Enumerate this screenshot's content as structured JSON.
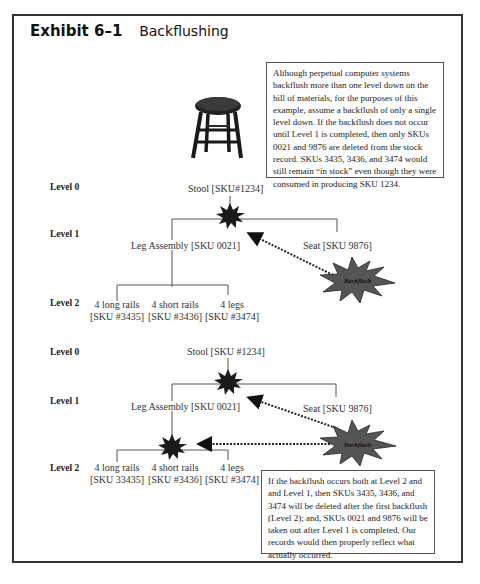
{
  "exhibit": {
    "number": "Exhibit 6–1",
    "title": "Backflushing"
  },
  "notes": {
    "top": "Although perpetual computer systems backflush more than one level down on the bill of materials, for the purposes of this example, assume a backflush of only a single level down. If the backflush does not occur until Level 1 is completed, then only SKUs 0021 and 9876 are deleted from the stock record. SKUs 3435, 3436, and 3474 would still remain “in stock” even though they were consumed in producing SKU 1234.",
    "bottom": "If the backflush occurs both at Level 2 and and Level 1, then SKUs 3435, 3436, and 3474 will be deleted after the first backflush (Level 2); and, SKUs 0021 and 9876 will be taken out after Level 1 is completed. Our records would then properly reflect what actually occurred."
  },
  "diagram_top": {
    "levels": [
      "Level 0",
      "Level 1",
      "Level 2"
    ],
    "level0": "Stool [SKU#1234]",
    "level1": [
      "Leg Assembly [SKU 0021]",
      "Seat [SKU 9876]"
    ],
    "level2": [
      {
        "name": "4 long rails",
        "sku": "[SKU #3435]"
      },
      {
        "name": "4 short rails",
        "sku": "[SKU #3436]"
      },
      {
        "name": "4 legs",
        "sku": "[SKU #3474]"
      }
    ],
    "backflush_label": "Backflush"
  },
  "diagram_bottom": {
    "levels": [
      "Level 0",
      "Level 1",
      "Level 2"
    ],
    "level0": "Stool [SKU #1234]",
    "level1": [
      "Leg Assembly [SKU 0021]",
      "Seat [SKU 9876]"
    ],
    "level2": [
      {
        "name": "4 long rails",
        "sku": "[SKU 33435]"
      },
      {
        "name": "4 short rails",
        "sku": "[SKU #3436]"
      },
      {
        "name": "4 legs",
        "sku": "[SKU #3474]"
      }
    ],
    "backflush_label": "Backflush"
  },
  "colors": {
    "frame": "#333333",
    "burst_small": "#1a1a1a",
    "burst_large": "#555555",
    "lines": "#555555"
  }
}
